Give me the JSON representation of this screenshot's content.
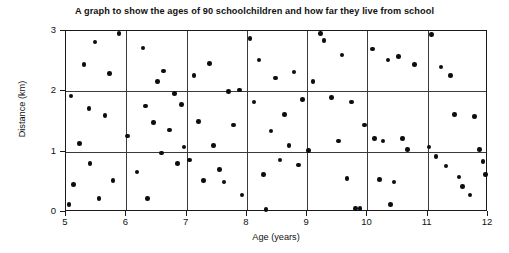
{
  "chart_data": {
    "type": "scatter",
    "title": "A graph to show the ages of 90 schoolchildren and how far they live from school",
    "xlabel": "Age (years)",
    "ylabel": "Distance (km)",
    "xlim": [
      5,
      12
    ],
    "ylim": [
      0,
      3
    ],
    "xticks": [
      5,
      6,
      7,
      8,
      9,
      10,
      11,
      12
    ],
    "yticks": [
      0,
      1,
      2,
      3
    ],
    "xtick_labels": [
      "5",
      "6",
      "7",
      "8",
      "9",
      "10",
      "11",
      "12"
    ],
    "ytick_labels": [
      "0",
      "1",
      "2",
      "3"
    ],
    "grid": true,
    "grid_color": "#3a3a3a",
    "legend": null,
    "point_color": "#0d0d0d",
    "n_points": 90,
    "points": [
      [
        5.05,
        0.12
      ],
      [
        5.08,
        1.92
      ],
      [
        5.12,
        0.46
      ],
      [
        5.22,
        1.14
      ],
      [
        5.3,
        2.44
      ],
      [
        5.38,
        1.72
      ],
      [
        5.4,
        0.8
      ],
      [
        5.48,
        2.82
      ],
      [
        5.55,
        0.22
      ],
      [
        5.65,
        1.6
      ],
      [
        5.72,
        2.3
      ],
      [
        5.78,
        0.52
      ],
      [
        5.88,
        2.96
      ],
      [
        6.02,
        1.26
      ],
      [
        6.18,
        0.66
      ],
      [
        6.28,
        2.72
      ],
      [
        6.32,
        1.76
      ],
      [
        6.35,
        0.22
      ],
      [
        6.45,
        1.48
      ],
      [
        6.52,
        2.16
      ],
      [
        6.58,
        0.98
      ],
      [
        6.62,
        2.34
      ],
      [
        6.72,
        1.36
      ],
      [
        6.8,
        1.96
      ],
      [
        6.85,
        0.8
      ],
      [
        6.92,
        1.78
      ],
      [
        6.96,
        1.08
      ],
      [
        7.05,
        0.86
      ],
      [
        7.12,
        2.26
      ],
      [
        7.2,
        1.5
      ],
      [
        7.28,
        0.52
      ],
      [
        7.38,
        2.46
      ],
      [
        7.45,
        1.1
      ],
      [
        7.55,
        0.7
      ],
      [
        7.62,
        0.5
      ],
      [
        7.7,
        2.0
      ],
      [
        7.78,
        1.44
      ],
      [
        7.88,
        2.02
      ],
      [
        7.92,
        0.28
      ],
      [
        8.05,
        2.88
      ],
      [
        8.12,
        1.82
      ],
      [
        8.2,
        2.52
      ],
      [
        8.28,
        0.62
      ],
      [
        8.32,
        0.04
      ],
      [
        8.4,
        1.34
      ],
      [
        8.48,
        2.22
      ],
      [
        8.55,
        0.86
      ],
      [
        8.62,
        1.62
      ],
      [
        8.7,
        1.1
      ],
      [
        8.78,
        2.32
      ],
      [
        8.86,
        0.78
      ],
      [
        8.92,
        1.86
      ],
      [
        9.02,
        1.02
      ],
      [
        9.1,
        2.16
      ],
      [
        9.22,
        2.96
      ],
      [
        9.28,
        2.84
      ],
      [
        9.4,
        1.9
      ],
      [
        9.52,
        1.18
      ],
      [
        9.58,
        2.6
      ],
      [
        9.66,
        0.56
      ],
      [
        9.74,
        1.82
      ],
      [
        9.8,
        0.06
      ],
      [
        9.88,
        0.06
      ],
      [
        9.95,
        1.44
      ],
      [
        10.08,
        2.7
      ],
      [
        10.12,
        1.22
      ],
      [
        10.2,
        0.54
      ],
      [
        10.26,
        1.18
      ],
      [
        10.34,
        2.52
      ],
      [
        10.38,
        0.12
      ],
      [
        10.44,
        0.5
      ],
      [
        10.52,
        2.58
      ],
      [
        10.58,
        1.22
      ],
      [
        10.66,
        1.04
      ],
      [
        10.78,
        2.44
      ],
      [
        11.02,
        1.08
      ],
      [
        11.06,
        2.94
      ],
      [
        11.14,
        0.92
      ],
      [
        11.22,
        2.4
      ],
      [
        11.3,
        0.76
      ],
      [
        11.38,
        2.26
      ],
      [
        11.44,
        1.62
      ],
      [
        11.52,
        0.58
      ],
      [
        11.58,
        0.42
      ],
      [
        11.7,
        0.28
      ],
      [
        11.78,
        1.58
      ],
      [
        11.86,
        1.04
      ],
      [
        11.92,
        0.84
      ],
      [
        11.96,
        0.62
      ]
    ]
  }
}
